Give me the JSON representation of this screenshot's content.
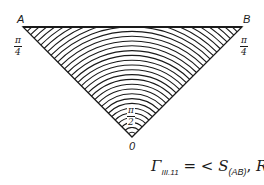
{
  "figure": {
    "vertices": {
      "A": {
        "label": "A",
        "x": 23,
        "y": 27
      },
      "B": {
        "label": "B",
        "x": 242,
        "y": 27
      },
      "O": {
        "label": "0",
        "x": 132,
        "y": 137
      }
    },
    "angle_labels": {
      "at_A": {
        "num": "π",
        "den": "4"
      },
      "at_B": {
        "num": "π",
        "den": "4"
      },
      "at_O": {
        "num": "π",
        "den": "2"
      }
    },
    "arcs": {
      "count": 32,
      "spacing": 4.8,
      "center": "O"
    },
    "line_color": "#1a1a1a"
  },
  "formula": {
    "gamma": "Γ",
    "gamma_sub": "III.11",
    "equals": "=",
    "open": "<",
    "S": "S",
    "S_sub": "(AB)",
    "comma": ",",
    "R": "R",
    "R_sub": "0",
    "R_sup": "π/2",
    "close": ">"
  }
}
